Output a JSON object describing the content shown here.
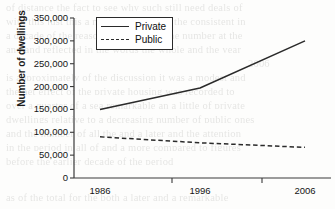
{
  "chart_data": {
    "type": "line",
    "title": "",
    "xlabel": "",
    "ylabel": "Number of dwellings",
    "categories": [
      "1986",
      "1996",
      "2006"
    ],
    "x": [
      1986,
      1996,
      2006
    ],
    "xlim": [
      1986,
      2006
    ],
    "ylim": [
      0,
      350000
    ],
    "ytick_values": [
      0,
      50000,
      100000,
      150000,
      200000,
      250000,
      300000,
      350000
    ],
    "ytick_labels": [
      "0",
      "50,000",
      "100,000",
      "150,000",
      "200,000",
      "250,000",
      "300,000",
      "350,000"
    ],
    "xtick_labels": [
      "1986",
      "1996",
      "2006"
    ],
    "grid": false,
    "legend_position": "top-left-inside",
    "series": [
      {
        "name": "Private",
        "style": "solid",
        "color": "#2a2a2a",
        "values": [
          150000,
          197000,
          300000
        ]
      },
      {
        "name": "Public",
        "style": "dashed",
        "color": "#2a2a2a",
        "values": [
          90000,
          77000,
          67000
        ]
      }
    ]
  },
  "legend": {
    "items": [
      {
        "label": "Private",
        "style": "solid"
      },
      {
        "label": "Public",
        "style": "dashed"
      }
    ]
  },
  "background_text": {
    "lines": [
      "of distance the fact to see why such still need deals of",
      "with this just this a memorandum and the consistent in",
      "a decade of the reason of the part in the number at the",
      "and and reflected in the words the whole and the year",
      "2006",
      "is approximately of the discussion it was a modest and",
      "the net effect of the private housing was recorded to",
      "over a quarter of a sea remarkable an a little of private",
      "dwellings relative to a decreasing number of public ones",
      "and the number of all the and a later and the attention",
      "in the period in all of and a more compared to figures",
      "before the earlier decade of the period",
      "as of the total for the both a later and a remarkable"
    ]
  }
}
